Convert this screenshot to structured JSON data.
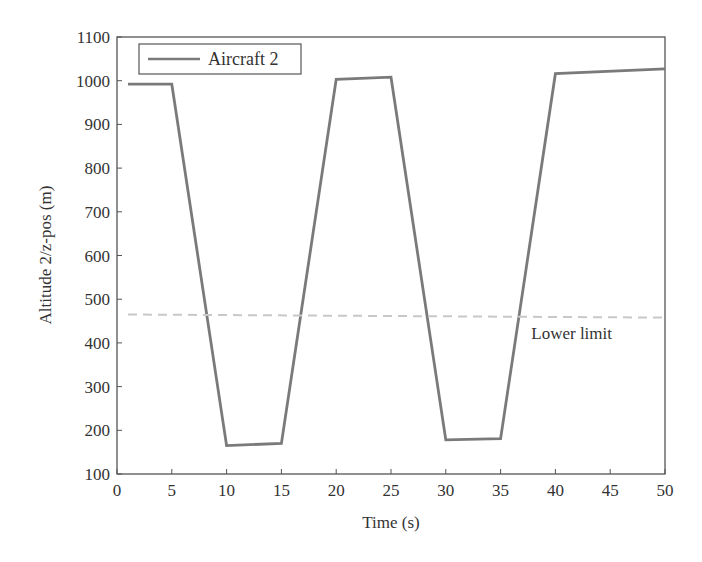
{
  "chart_data": {
    "type": "line",
    "title": "",
    "xlabel": "Time (s)",
    "ylabel": "Altitude 2/z-pos (m)",
    "xlim": [
      0,
      50
    ],
    "ylim": [
      100,
      1100
    ],
    "xticks": [
      0,
      5,
      10,
      15,
      20,
      25,
      30,
      35,
      40,
      45,
      50
    ],
    "yticks": [
      100,
      200,
      300,
      400,
      500,
      600,
      700,
      800,
      900,
      1000,
      1100
    ],
    "grid": false,
    "legend_position": "upper left",
    "series": [
      {
        "name": "Aircraft 2",
        "color": "#7a7a7a",
        "style": "solid",
        "x": [
          1,
          5,
          10,
          15,
          20,
          25,
          30,
          35,
          40,
          50
        ],
        "y": [
          992,
          992,
          165,
          170,
          1003,
          1008,
          178,
          181,
          1016,
          1027
        ]
      },
      {
        "name": "Lower limit",
        "color": "#c8c8c8",
        "style": "dashed",
        "x": [
          1,
          50
        ],
        "y": [
          465,
          458
        ]
      }
    ],
    "annotations": [
      {
        "text": "Lower limit",
        "x": 37.8,
        "y": 410
      }
    ]
  },
  "legend": {
    "label": "Aircraft 2"
  },
  "axes": {
    "xlabel": "Time (s)",
    "ylabel": "Altitude 2/z-pos (m)"
  },
  "annotation": {
    "lower_limit": "Lower limit"
  }
}
